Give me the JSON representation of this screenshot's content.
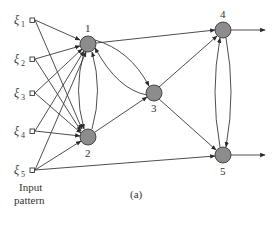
{
  "figure": {
    "caption": "(a)",
    "input_label_line1": "Input",
    "input_label_line2": "pattern",
    "colors": {
      "node_fill": "#8c8c8c",
      "stroke": "#3a3a3a",
      "background": "#ffffff"
    }
  },
  "inputs": [
    {
      "symbol": "ξ",
      "subscript": "1"
    },
    {
      "symbol": "ξ",
      "subscript": "2"
    },
    {
      "symbol": "ξ",
      "subscript": "3"
    },
    {
      "symbol": "ξ",
      "subscript": "4"
    },
    {
      "symbol": "ξ",
      "subscript": "5"
    }
  ],
  "nodes": [
    {
      "label": "1"
    },
    {
      "label": "2"
    },
    {
      "label": "3"
    },
    {
      "label": "4"
    },
    {
      "label": "5"
    }
  ],
  "edges": [
    "ξ1→1",
    "ξ1→2",
    "ξ2→1",
    "ξ2→2",
    "ξ3→1",
    "ξ3→2",
    "ξ4→1",
    "ξ4→2",
    "ξ5→1",
    "ξ5→2",
    "ξ5→5",
    "1→2",
    "2→1",
    "1→3",
    "3→1",
    "2→3",
    "1→4",
    "3→4",
    "3→5",
    "4→5",
    "5→4",
    "4→out",
    "5→out"
  ]
}
